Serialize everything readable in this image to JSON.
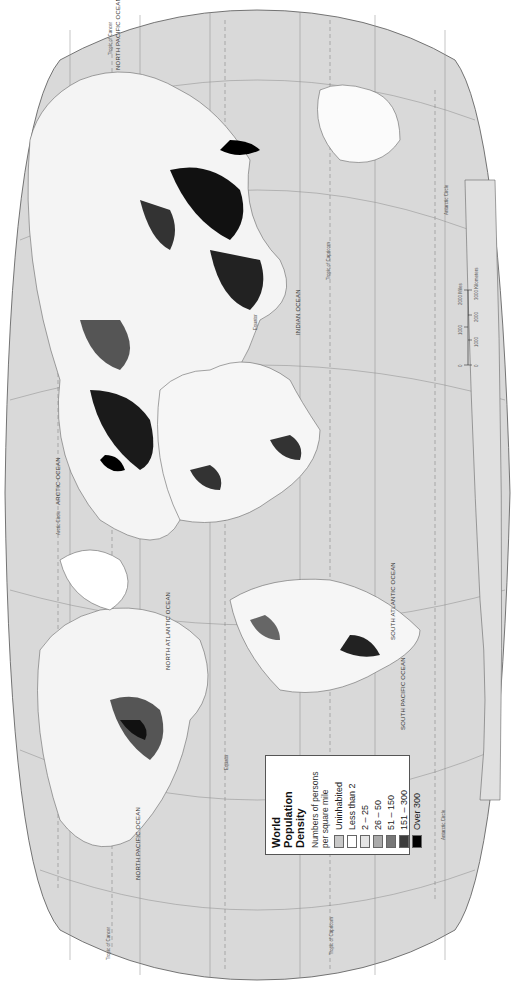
{
  "legend": {
    "title_line1": "World Population",
    "title_line2": "Density",
    "subtitle_line1": "Numbers of persons",
    "subtitle_line2": "per square mile",
    "items": [
      {
        "label": "Uninhabited",
        "color": "#c8c8c8"
      },
      {
        "label": "Less than 2",
        "color": "#ffffff"
      },
      {
        "label": "2 – 25",
        "color": "#e4e4e4"
      },
      {
        "label": "26 – 50",
        "color": "#aaaaaa"
      },
      {
        "label": "51 – 150",
        "color": "#777777"
      },
      {
        "label": "151 – 300",
        "color": "#3c3c3c"
      },
      {
        "label": "Over 300",
        "color": "#000000"
      }
    ]
  },
  "oceans": {
    "north_pacific_west": "NORTH PACIFIC OCEAN",
    "north_pacific_east": "NORTH PACIFIC OCEAN",
    "north_atlantic": "NORTH ATLANTIC OCEAN",
    "south_atlantic": "SOUTH ATLANTIC OCEAN",
    "south_pacific": "SOUTH PACIFIC OCEAN",
    "arctic": "ARCTIC OCEAN",
    "indian": "INDIAN OCEAN"
  },
  "lines": {
    "equator_west": "Equator",
    "equator_east": "Equator",
    "tropic_cancer_west": "Tropic of Cancer",
    "tropic_cancer_east": "Tropic of Cancer",
    "tropic_capricorn_west": "Tropic of Capricorn",
    "tropic_capricorn_east": "Tropic of Capricorn",
    "arctic_circle": "Arctic Circle",
    "antarctic_circle_west": "Antarctic Circle",
    "antarctic_circle_east": "Antarctic Circle"
  },
  "scale_bar": {
    "miles_ticks": [
      "0",
      "1000",
      "2000 Miles"
    ],
    "km_ticks": [
      "0",
      "1000",
      "2000",
      "3000 Kilometers"
    ]
  },
  "colors": {
    "ocean": "#d9d9d9",
    "outline": "#666666",
    "background": "#ffffff"
  }
}
